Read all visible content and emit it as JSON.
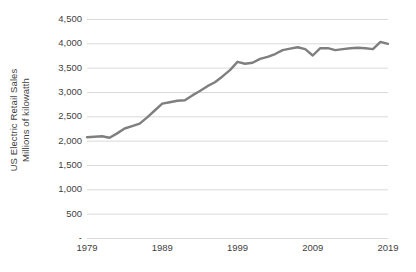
{
  "chart_data": {
    "type": "line",
    "title": "",
    "subtitle": "",
    "xlabel": "",
    "ylabel": "US Electric Retail Sales Millions of kilowatth",
    "ylabel_line1": "US Electric Retail Sales",
    "ylabel_line2": "Millions of kilowatth",
    "grid": true,
    "legend": "none",
    "line_color": "#7f7f7f",
    "gridline_color": "#d9d9d9",
    "text_color": "#3f3f3f",
    "background_color": "#ffffff",
    "xlim": [
      1979,
      2019
    ],
    "ylim": [
      0,
      4500
    ],
    "y_tick_values": [
      4500,
      4000,
      3500,
      3000,
      2500,
      2000,
      1500,
      1000,
      500,
      0
    ],
    "y_tick_labels": [
      "4,500",
      "4,000",
      "3,500",
      "3,000",
      "2,500",
      "2,000",
      "1,500",
      "1,000",
      "500",
      "-"
    ],
    "x_tick_values": [
      1979,
      1989,
      1999,
      2009,
      2019
    ],
    "x_tick_labels": [
      "1979",
      "1989",
      "1999",
      "2009",
      "2019"
    ],
    "x": [
      1979,
      1980,
      1981,
      1982,
      1983,
      1984,
      1985,
      1986,
      1987,
      1988,
      1989,
      1990,
      1991,
      1992,
      1993,
      1994,
      1995,
      1996,
      1997,
      1998,
      1999,
      2000,
      2001,
      2002,
      2003,
      2004,
      2005,
      2006,
      2007,
      2008,
      2009,
      2010,
      2011,
      2012,
      2013,
      2014,
      2015,
      2016,
      2017,
      2018,
      2019
    ],
    "values": [
      2070,
      2080,
      2090,
      2060,
      2150,
      2250,
      2300,
      2350,
      2480,
      2620,
      2760,
      2790,
      2820,
      2830,
      2930,
      3020,
      3120,
      3200,
      3320,
      3450,
      3620,
      3580,
      3600,
      3680,
      3720,
      3780,
      3860,
      3890,
      3920,
      3880,
      3750,
      3900,
      3900,
      3860,
      3880,
      3900,
      3910,
      3900,
      3880,
      4030,
      3990
    ],
    "series": [
      {
        "name": "US Electric Retail Sales",
        "color": "#7f7f7f",
        "values": [
          2070,
          2080,
          2090,
          2060,
          2150,
          2250,
          2300,
          2350,
          2480,
          2620,
          2760,
          2790,
          2820,
          2830,
          2930,
          3020,
          3120,
          3200,
          3320,
          3450,
          3620,
          3580,
          3600,
          3680,
          3720,
          3780,
          3860,
          3890,
          3920,
          3880,
          3750,
          3900,
          3900,
          3860,
          3880,
          3900,
          3910,
          3900,
          3880,
          4030,
          3990
        ]
      }
    ]
  }
}
